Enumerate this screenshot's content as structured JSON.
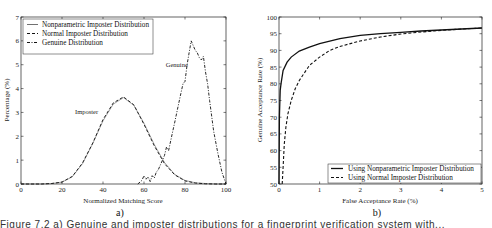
{
  "chart_data": [
    {
      "id": "a",
      "type": "line",
      "panel_label": "a)",
      "title": "",
      "xlabel": "Normalized Matching Score",
      "ylabel": "Percentage (%)",
      "xlim": [
        0,
        100
      ],
      "ylim": [
        0,
        7
      ],
      "xticks": [
        0,
        20,
        40,
        60,
        80,
        100
      ],
      "yticks": [
        0,
        1,
        2,
        3,
        4,
        5,
        6,
        7
      ],
      "grid": false,
      "legend_position": "upper left",
      "annotations": [
        {
          "text": "Imposter",
          "x": 32,
          "y": 2.95
        },
        {
          "text": "Genuine",
          "x": 76,
          "y": 4.9
        }
      ],
      "series": [
        {
          "name": "Nonparametric Imposter Distribution",
          "style": "solid",
          "x": [
            0,
            10,
            15,
            20,
            25,
            30,
            35,
            40,
            45,
            50,
            55,
            60,
            65,
            70,
            75,
            80,
            85,
            90,
            95,
            100
          ],
          "y": [
            0,
            0,
            0.02,
            0.08,
            0.3,
            0.85,
            1.7,
            2.65,
            3.35,
            3.62,
            3.3,
            2.55,
            1.65,
            0.9,
            0.4,
            0.15,
            0.05,
            0.02,
            0,
            0
          ]
        },
        {
          "name": "Normal Imposter Distribution",
          "style": "dashed",
          "x": [
            0,
            10,
            15,
            20,
            25,
            30,
            35,
            40,
            45,
            50,
            55,
            60,
            65,
            70,
            75,
            80,
            85,
            90,
            95,
            100
          ],
          "y": [
            0,
            0,
            0.02,
            0.08,
            0.32,
            0.88,
            1.72,
            2.7,
            3.4,
            3.65,
            3.32,
            2.5,
            1.6,
            0.85,
            0.38,
            0.13,
            0.04,
            0.01,
            0,
            0
          ]
        },
        {
          "name": "Genuine Distribution",
          "style": "dashdot",
          "x": [
            57,
            59,
            60,
            61,
            62,
            63,
            64,
            65,
            66,
            67,
            68,
            70,
            71,
            72,
            74,
            75,
            76,
            78,
            79,
            80,
            81,
            82,
            83,
            84,
            85,
            86,
            87,
            88,
            89,
            90,
            91,
            92,
            94,
            96,
            98,
            100
          ],
          "y": [
            0,
            0.15,
            0.35,
            0.2,
            0.3,
            0.1,
            0.35,
            0.25,
            0.5,
            0.6,
            0.8,
            1.2,
            1.55,
            1.4,
            2.2,
            2.6,
            3.0,
            3.8,
            4.2,
            4.3,
            5.0,
            5.5,
            6.0,
            5.8,
            5.6,
            5.5,
            5.3,
            5.2,
            5.35,
            4.7,
            4.2,
            3.5,
            2.2,
            1.3,
            0.5,
            0
          ]
        }
      ]
    },
    {
      "id": "b",
      "type": "line",
      "panel_label": "b)",
      "title": "",
      "xlabel": "False Acceptance Rate (%)",
      "ylabel": "Genuine Acceptance Rate (%)",
      "xlim": [
        0,
        5
      ],
      "ylim": [
        50,
        100
      ],
      "xticks": [
        0,
        1,
        2,
        3,
        4,
        5
      ],
      "yticks": [
        50,
        55,
        60,
        65,
        70,
        75,
        80,
        85,
        90,
        95,
        100
      ],
      "grid": false,
      "legend_position": "lower right",
      "series": [
        {
          "name": "Using Nonparametric Imposter Distribution",
          "style": "solid",
          "x": [
            0.0,
            0.01,
            0.03,
            0.05,
            0.1,
            0.2,
            0.3,
            0.5,
            0.75,
            1.0,
            1.5,
            2.0,
            2.5,
            3.0,
            3.5,
            4.0,
            4.5,
            5.0
          ],
          "y": [
            50,
            70,
            78,
            80,
            84,
            86.5,
            88,
            89.8,
            91,
            92,
            93.5,
            94.5,
            95,
            95.4,
            95.8,
            96.1,
            96.4,
            96.7
          ]
        },
        {
          "name": "Using Normal Imposter Distribution",
          "style": "dashed",
          "x": [
            0.08,
            0.1,
            0.13,
            0.17,
            0.22,
            0.3,
            0.4,
            0.5,
            0.75,
            1.0,
            1.25,
            1.5,
            2.0,
            2.5,
            3.0,
            3.5,
            4.0,
            4.5,
            5.0
          ],
          "y": [
            50,
            55,
            62,
            67,
            71,
            75,
            78.5,
            81,
            85.5,
            88,
            90,
            91.2,
            92.8,
            94,
            94.9,
            95.5,
            96,
            96.4,
            96.7
          ]
        }
      ]
    }
  ],
  "caption": "Figure 7.2  a) Genuine and imposter distributions for a fingerprint verification system with..."
}
